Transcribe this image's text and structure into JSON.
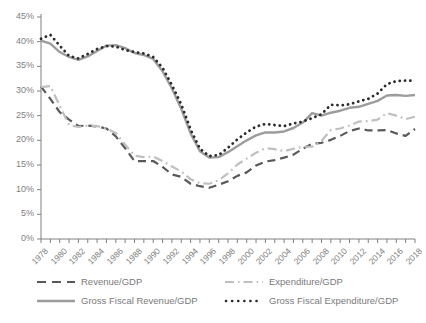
{
  "chart_data": {
    "type": "line",
    "title": "",
    "xlabel": "",
    "ylabel": "",
    "ylim": [
      0,
      45
    ],
    "ytick_labels": [
      "0%",
      "5%",
      "10%",
      "15%",
      "20%",
      "25%",
      "30%",
      "35%",
      "40%",
      "45%"
    ],
    "ytick_values": [
      0,
      5,
      10,
      15,
      20,
      25,
      30,
      35,
      40,
      45
    ],
    "grid": false,
    "legend_position": "bottom",
    "x": [
      1978,
      1979,
      1980,
      1981,
      1982,
      1983,
      1984,
      1985,
      1986,
      1987,
      1988,
      1989,
      1990,
      1991,
      1992,
      1993,
      1994,
      1995,
      1996,
      1997,
      1998,
      1999,
      2000,
      2001,
      2002,
      2003,
      2004,
      2005,
      2006,
      2007,
      2008,
      2009,
      2010,
      2011,
      2012,
      2013,
      2014,
      2015,
      2016,
      2017,
      2018
    ],
    "xtick_labels": [
      "1978",
      "1980",
      "1982",
      "1984",
      "1986",
      "1988",
      "1990",
      "1992",
      "1994",
      "1996",
      "1998",
      "2000",
      "2002",
      "2004",
      "2006",
      "2008",
      "2010",
      "2012",
      "2014",
      "2016",
      "2018"
    ],
    "series": [
      {
        "name": "Revenue/GDP",
        "color": "#595959",
        "style": "dashed",
        "values": [
          30.9,
          28.4,
          25.7,
          24.2,
          22.9,
          23.0,
          22.8,
          22.4,
          20.8,
          18.4,
          15.8,
          15.8,
          15.8,
          14.6,
          13.1,
          12.6,
          11.2,
          10.7,
          10.4,
          11.0,
          11.7,
          12.8,
          13.5,
          14.9,
          15.7,
          16.0,
          16.5,
          17.1,
          18.3,
          19.3,
          19.5,
          20.1,
          20.9,
          21.9,
          22.4,
          22.0,
          22.0,
          22.1,
          21.4,
          20.9,
          22.3
        ]
      },
      {
        "name": "Expenditure/GDP",
        "color": "#bfbfbf",
        "style": "dashdot",
        "values": [
          30.8,
          31.0,
          27.0,
          23.1,
          22.7,
          23.0,
          22.9,
          22.4,
          21.5,
          19.1,
          16.9,
          16.6,
          16.7,
          15.8,
          14.7,
          13.7,
          12.1,
          11.3,
          11.2,
          11.9,
          13.3,
          15.1,
          16.3,
          17.5,
          18.4,
          18.2,
          17.8,
          18.3,
          18.7,
          18.7,
          19.9,
          22.1,
          22.4,
          23.0,
          23.8,
          23.9,
          24.2,
          25.5,
          25.0,
          24.3,
          24.8
        ]
      },
      {
        "name": "Gross Fiscal Revenue/GDP",
        "color": "#9c9c9c",
        "style": "solid",
        "values": [
          40.2,
          39.6,
          37.9,
          36.9,
          36.3,
          37.0,
          38.1,
          39.2,
          39.3,
          38.7,
          37.7,
          37.3,
          36.5,
          34.0,
          30.5,
          26.4,
          21.4,
          17.8,
          16.5,
          16.6,
          17.6,
          18.8,
          20.0,
          21.0,
          21.6,
          21.6,
          21.8,
          22.5,
          23.6,
          25.5,
          25.0,
          25.6,
          26.0,
          26.6,
          26.8,
          27.4,
          28.0,
          29.1,
          29.2,
          29.0,
          29.2
        ]
      },
      {
        "name": "Gross Fiscal Expenditure/GDP",
        "color": "#2b2b2b",
        "style": "dotted",
        "values": [
          40.6,
          41.4,
          39.2,
          37.1,
          36.6,
          37.5,
          38.5,
          39.1,
          39.0,
          38.3,
          37.9,
          37.6,
          36.9,
          34.7,
          31.2,
          27.3,
          22.2,
          18.3,
          16.8,
          17.0,
          18.5,
          20.2,
          21.6,
          22.8,
          23.3,
          23.1,
          22.9,
          23.4,
          23.8,
          24.5,
          25.3,
          27.2,
          27.1,
          27.3,
          27.9,
          28.4,
          29.5,
          31.4,
          32.0,
          32.1,
          32.1
        ]
      }
    ]
  },
  "legend": {
    "items": [
      {
        "label": "Revenue/GDP",
        "key": "dashed-dark-key"
      },
      {
        "label": "Expenditure/GDP",
        "key": "dashdot-light-key"
      },
      {
        "label": "Gross Fiscal Revenue/GDP",
        "key": "solid-gray-key"
      },
      {
        "label": "Gross Fiscal Expenditure/GDP",
        "key": "dotted-black-key"
      }
    ]
  },
  "axis": {
    "tick_color": "#808080",
    "line_color": "#808080",
    "label_color": "#808080"
  }
}
